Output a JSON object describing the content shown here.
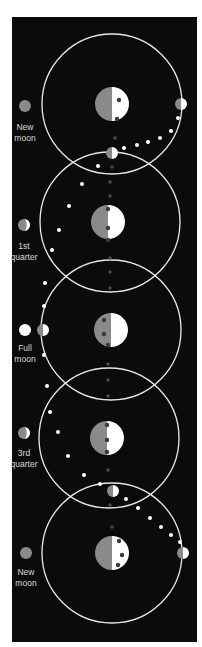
{
  "diagram": {
    "colors": {
      "background": "#0b0b0b",
      "orbit": "#e8e8e8",
      "lit": "#ffffff",
      "shadow": "#8a8a8a",
      "dot_light": "#ffffff",
      "dot_dark": "#3a3a3a",
      "axis_dot": "#4a4a4a",
      "label": "#d8d8d8"
    },
    "orbit_radius": 70,
    "frames": [
      {
        "earth": {
          "cx": 112,
          "cy": 104,
          "r": 17
        },
        "earth_dots": [
          [
            119,
            100
          ],
          [
            117,
            119
          ]
        ]
      },
      {
        "earth": {
          "cx": 108,
          "cy": 222,
          "r": 17
        },
        "earth_dots": [
          [
            108,
            209
          ],
          [
            108,
            228
          ],
          [
            108,
            240
          ]
        ]
      },
      {
        "earth": {
          "cx": 111,
          "cy": 330,
          "r": 17
        },
        "earth_dots": [
          [
            104,
            320
          ],
          [
            104,
            334
          ],
          [
            108,
            345
          ]
        ]
      },
      {
        "earth": {
          "cx": 107,
          "cy": 438,
          "r": 17
        },
        "earth_dots": [
          [
            107,
            425
          ],
          [
            107,
            440
          ],
          [
            107,
            452
          ]
        ]
      },
      {
        "earth": {
          "cx": 112,
          "cy": 553,
          "r": 17
        },
        "earth_dots": [
          [
            119,
            541
          ],
          [
            122,
            555
          ],
          [
            118,
            565
          ]
        ]
      }
    ],
    "orbit_centers": [
      [
        112,
        104
      ],
      [
        110,
        222
      ],
      [
        111,
        330
      ],
      [
        109,
        438
      ],
      [
        112,
        553
      ]
    ],
    "moons_on_orbit": [
      {
        "cx": 181,
        "cy": 104,
        "r": 6
      },
      {
        "cx": 112,
        "cy": 153,
        "r": 6
      },
      {
        "cx": 43,
        "cy": 330,
        "r": 6
      },
      {
        "cx": 113,
        "cy": 491,
        "r": 6
      },
      {
        "cx": 183,
        "cy": 553,
        "r": 6
      }
    ],
    "path_dots": [
      [
        178,
        118
      ],
      [
        171,
        131
      ],
      [
        160,
        138
      ],
      [
        148,
        142
      ],
      [
        137,
        145
      ],
      [
        124,
        148
      ],
      [
        98,
        166
      ],
      [
        82,
        184
      ],
      [
        69,
        206
      ],
      [
        59,
        230
      ],
      [
        52,
        250
      ],
      [
        45,
        283
      ],
      [
        44,
        306
      ],
      [
        44,
        355
      ],
      [
        47,
        386
      ],
      [
        50,
        412
      ],
      [
        58,
        432
      ],
      [
        68,
        456
      ],
      [
        84,
        475
      ],
      [
        100,
        484
      ],
      [
        126,
        499
      ],
      [
        138,
        508
      ],
      [
        150,
        518
      ],
      [
        161,
        527
      ],
      [
        171,
        535
      ],
      [
        180,
        542
      ]
    ],
    "axis_dots": [
      [
        115,
        138
      ],
      [
        112,
        167
      ],
      [
        110,
        182
      ],
      [
        110,
        196
      ],
      [
        110,
        258
      ],
      [
        110,
        272
      ],
      [
        110,
        288
      ],
      [
        108,
        364
      ],
      [
        108,
        380
      ],
      [
        108,
        396
      ],
      [
        108,
        470
      ],
      [
        110,
        505
      ],
      [
        112,
        527
      ]
    ],
    "phases": [
      {
        "label_line1": "New",
        "label_line2": "moon",
        "icon": {
          "cx": 25,
          "cy": 106,
          "r": 6,
          "type": "new"
        },
        "label_y": 122
      },
      {
        "label_line1": "1st",
        "label_line2": "quarter",
        "icon": {
          "cx": 24,
          "cy": 225,
          "r": 6,
          "type": "first"
        },
        "label_y": 241
      },
      {
        "label_line1": "Full",
        "label_line2": "moon",
        "icon": {
          "cx": 25,
          "cy": 330,
          "r": 6,
          "type": "full"
        },
        "label_y": 343
      },
      {
        "label_line1": "3rd",
        "label_line2": "quarter",
        "icon": {
          "cx": 24,
          "cy": 433,
          "r": 6,
          "type": "third"
        },
        "label_y": 448
      },
      {
        "label_line1": "New",
        "label_line2": "moon",
        "icon": {
          "cx": 26,
          "cy": 553,
          "r": 6,
          "type": "new"
        },
        "label_y": 567
      }
    ]
  }
}
